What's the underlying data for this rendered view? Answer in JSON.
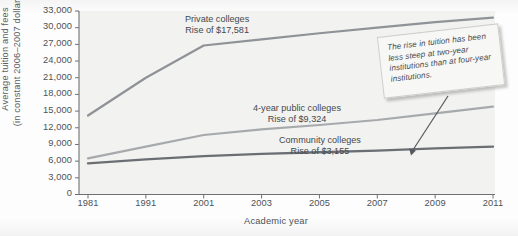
{
  "chart_data": {
    "type": "line",
    "title": "",
    "xlabel": "Academic year",
    "ylabel": "Average tuition and fees (in constant 2006–2007 dollars)",
    "ylabel_line1": "Average tuition and fees",
    "ylabel_line2": "(in constant 2006–2007 dollars)",
    "categories": [
      "1981",
      "1991",
      "2001",
      "2003",
      "2005",
      "2007",
      "2009",
      "2011"
    ],
    "yticks": [
      "0",
      "3,000",
      "6,000",
      "9,000",
      "12,000",
      "15,000",
      "18,000",
      "21,000",
      "24,000",
      "27,000",
      "30,000",
      "33,000"
    ],
    "ytick_values": [
      0,
      3000,
      6000,
      9000,
      12000,
      15000,
      18000,
      21000,
      24000,
      27000,
      30000,
      33000
    ],
    "ylim": [
      0,
      33000
    ],
    "grid": false,
    "legend_position": "inline-annotations",
    "series": [
      {
        "name": "Private colleges",
        "annotation_line1": "Private colleges",
        "annotation_line2": "Rise of $17,581",
        "rise": "$17,581",
        "color": "#8f9296",
        "values": [
          14200,
          21000,
          26800,
          27900,
          29000,
          30000,
          31000,
          31800
        ]
      },
      {
        "name": "4-year public colleges",
        "annotation_line1": "4-year public colleges",
        "annotation_line2": "Rise of $9,324",
        "rise": "$9,324",
        "color": "#a7aaad",
        "values": [
          6500,
          8600,
          10700,
          11700,
          12500,
          13400,
          14600,
          15800
        ]
      },
      {
        "name": "Community colleges",
        "annotation_line1": "Community colleges",
        "annotation_line2": "Rise of $3,155",
        "rise": "$3,155",
        "color": "#6b6f73",
        "values": [
          5600,
          6300,
          6900,
          7300,
          7600,
          7900,
          8300,
          8600
        ]
      }
    ],
    "callout": {
      "text": "The rise in tuition has been less steep at two-year institutions than at four-year institutions.",
      "pointer_target_series": "Community colleges",
      "pointer_target_year": "2009"
    },
    "colors": {
      "axis": "#6d7175",
      "text": "#4e5256",
      "plot_background": "#f2f2f0",
      "callout_background": "#f7f7f5"
    }
  }
}
